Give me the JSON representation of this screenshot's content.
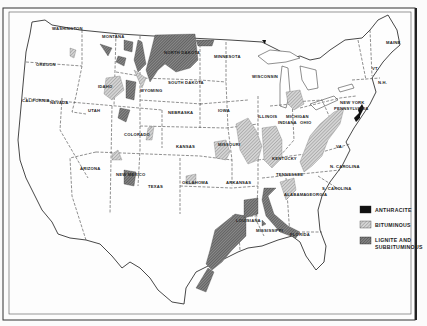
{
  "map": {
    "title": "Coal fields of the United States",
    "legend": {
      "items": [
        {
          "key": "anthracite",
          "label": "ANTHRACITE",
          "color": "#111111"
        },
        {
          "key": "bituminous",
          "label": "BITUMINOUS",
          "color": "#bdbdbd"
        },
        {
          "key": "lignite",
          "label_line1": "LIGNITE AND",
          "label_line2": "SUBBITUMINOUS",
          "color": "#6a6a6a"
        }
      ]
    },
    "state_labels": {
      "washington": "WASHINGTON",
      "oregon": "OREGON",
      "california": "CALIFORNIA",
      "nevada": "NEVADA",
      "idaho": "IDAHO",
      "montana": "MONTANA",
      "utah": "UTAH",
      "arizona": "ARIZONA",
      "wyoming": "WYOMING",
      "colorado": "COLORADO",
      "new_mexico": "NEW MEXICO",
      "north_dakota": "NORTH DAKOTA",
      "south_dakota": "SOUTH DAKOTA",
      "nebraska": "NEBRASKA",
      "kansas": "KANSAS",
      "oklahoma": "OKLAHOMA",
      "texas": "TEXAS",
      "minnesota": "MINNESOTA",
      "iowa": "IOWA",
      "missouri": "MISSOURI",
      "arkansas": "ARKANSAS",
      "louisiana": "LOUISIANA",
      "wisconsin": "WISCONSIN",
      "illinois": "ILLINOIS",
      "michigan": "MICHIGAN",
      "indiana": "INDIANA",
      "ohio": "OHIO",
      "kentucky": "KENTUCKY",
      "tennessee": "TENNESSEE",
      "mississippi": "MISSISSIPPI",
      "alabama": "ALABAMA",
      "georgia": "GEORGIA",
      "florida": "FLORIDA",
      "n_carolina": "N. CAROLINA",
      "s_carolina": "S. CAROLINA",
      "virginia": "VA.",
      "pennsylvania": "PENNSYLVANIA",
      "new_york": "NEW YORK",
      "maine": "MAINE",
      "vt": "VT.",
      "nh": "N.H."
    }
  }
}
